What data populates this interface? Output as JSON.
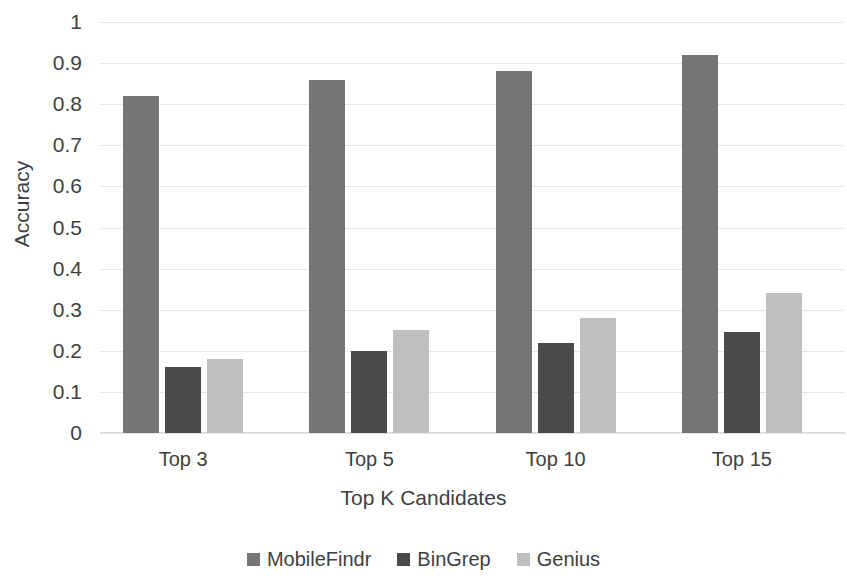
{
  "chart_data": {
    "type": "bar",
    "title": "",
    "xlabel": "Top K Candidates",
    "ylabel": "Accuracy",
    "categories": [
      "Top 3",
      "Top 5",
      "Top 10",
      "Top 15"
    ],
    "series": [
      {
        "name": "MobileFindr",
        "color": "#757575",
        "values": [
          0.82,
          0.86,
          0.88,
          0.92
        ]
      },
      {
        "name": "BinGrep",
        "color": "#4a4a4a",
        "values": [
          0.16,
          0.2,
          0.22,
          0.245
        ]
      },
      {
        "name": "Genius",
        "color": "#bfbfbf",
        "values": [
          0.18,
          0.25,
          0.28,
          0.34
        ]
      }
    ],
    "ylim": [
      0,
      1
    ],
    "ytick_values": [
      0,
      0.1,
      0.2,
      0.3,
      0.4,
      0.5,
      0.6,
      0.7,
      0.8,
      0.9,
      1
    ],
    "ytick_labels": [
      "0",
      "0.1",
      "0.2",
      "0.3",
      "0.4",
      "0.5",
      "0.6",
      "0.7",
      "0.8",
      "0.9",
      "1"
    ],
    "grid": true,
    "grid_color": "#e6e6e6",
    "legend_position": "bottom",
    "background": "#ffffff"
  }
}
